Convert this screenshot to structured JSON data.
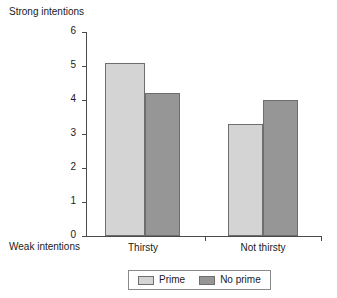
{
  "chart_data": {
    "type": "bar",
    "title": "",
    "xlabel": "",
    "ylabel": "",
    "ylim": [
      0,
      6
    ],
    "yticks": [
      "0",
      "1",
      "2",
      "3",
      "4",
      "5",
      "6"
    ],
    "grid": false,
    "categories": [
      "Thirsty",
      "Not thirsty"
    ],
    "series": [
      {
        "name": "Prime",
        "values": [
          5.1,
          3.3
        ],
        "color": "#d4d4d4"
      },
      {
        "name": "No prime",
        "values": [
          4.2,
          4.0
        ],
        "color": "#969696"
      }
    ],
    "annotations": {
      "axis_top_label": "Strong intentions",
      "axis_bottom_label": "Weak intentions"
    },
    "legend_position": "bottom-center"
  },
  "axis": {
    "top_label": "Strong intentions",
    "bottom_label": "Weak intentions",
    "tick_6": "6",
    "tick_5": "5",
    "tick_4": "4",
    "tick_3": "3",
    "tick_2": "2",
    "tick_1": "1",
    "tick_0": "0"
  },
  "categories": {
    "cat_0": "Thirsty",
    "cat_1": "Not thirsty"
  },
  "legend": {
    "item_0": "Prime",
    "item_1": "No prime"
  }
}
